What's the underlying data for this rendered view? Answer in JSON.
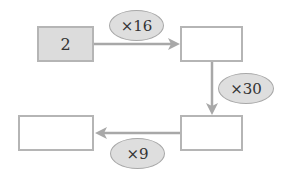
{
  "diagram": {
    "type": "operation-flow",
    "boxes": [
      {
        "id": "start",
        "value": "2",
        "filled": true
      },
      {
        "id": "step1",
        "value": "",
        "filled": false
      },
      {
        "id": "step2",
        "value": "",
        "filled": false
      },
      {
        "id": "result",
        "value": "",
        "filled": false
      }
    ],
    "operations": [
      {
        "from": "start",
        "to": "step1",
        "label": "×16"
      },
      {
        "from": "step1",
        "to": "step2",
        "label": "×30"
      },
      {
        "from": "step2",
        "to": "result",
        "label": "×9"
      }
    ],
    "colors": {
      "border": "#b5b5b5",
      "filled_box": "#dcdcdc",
      "oval_fill": "#dedede",
      "arrow": "#a8a8a8"
    }
  }
}
